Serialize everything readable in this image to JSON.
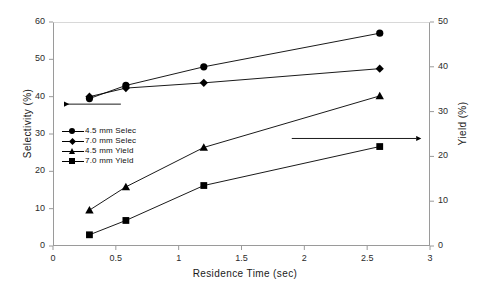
{
  "chart_data": {
    "type": "line",
    "title": "",
    "xlabel": "Residence Time (sec)",
    "ylabel": "Selectivity (%)",
    "ylabel_right": "Yield (%)",
    "xlim": [
      0,
      3
    ],
    "ylim": [
      0,
      60
    ],
    "ylim_right": [
      0,
      50
    ],
    "xticks": [
      "0",
      "0.5",
      "1",
      "1.5",
      "2",
      "2.5",
      "3"
    ],
    "xtick_values": [
      0,
      0.5,
      1,
      1.5,
      2,
      2.5,
      3
    ],
    "yticks_left": [
      "0",
      "10",
      "20",
      "30",
      "40",
      "50",
      "60"
    ],
    "ytick_values_left": [
      0,
      10,
      20,
      30,
      40,
      50,
      60
    ],
    "yticks_right": [
      "0",
      "10",
      "20",
      "30",
      "40",
      "50"
    ],
    "ytick_values_right": [
      0,
      10,
      20,
      30,
      40,
      50
    ],
    "grid": false,
    "legend_position": "center-left-inside",
    "x": [
      0.29,
      0.58,
      1.2,
      2.6
    ],
    "series": [
      {
        "name": "4.5 mm Selec",
        "marker": "circle",
        "axis": "left",
        "color": "#000000",
        "values": [
          39.5,
          43.0,
          48.0,
          57.0
        ]
      },
      {
        "name": "7.0 mm Selec",
        "marker": "diamond",
        "axis": "left",
        "color": "#000000",
        "values": [
          40.0,
          42.3,
          43.7,
          47.5
        ]
      },
      {
        "name": "4.5 mm Yield",
        "marker": "triangle",
        "axis": "right",
        "color": "#000000",
        "values": [
          8.0,
          13.2,
          22.0,
          33.5
        ]
      },
      {
        "name": "7.0 mm Yield",
        "marker": "square",
        "axis": "right",
        "color": "#000000",
        "values": [
          2.5,
          5.7,
          13.5,
          22.2
        ]
      }
    ],
    "annotations": [
      {
        "name": "left-axis-arrow",
        "type": "arrow",
        "direction": "left",
        "label": "",
        "x_start": 0.54,
        "x_end": 0.04,
        "y_left_axis": 38.0
      },
      {
        "name": "right-axis-arrow",
        "type": "arrow",
        "direction": "right",
        "label": "",
        "x_start": 1.9,
        "x_end": 2.93,
        "y_right_axis": 24.0
      }
    ]
  },
  "legend": {
    "items": [
      {
        "label": "4.5 mm Selec",
        "marker": "circle"
      },
      {
        "label": "7.0 mm Selec",
        "marker": "diamond"
      },
      {
        "label": "4.5 mm Yield",
        "marker": "triangle"
      },
      {
        "label": "7.0 mm Yield",
        "marker": "square"
      }
    ]
  }
}
